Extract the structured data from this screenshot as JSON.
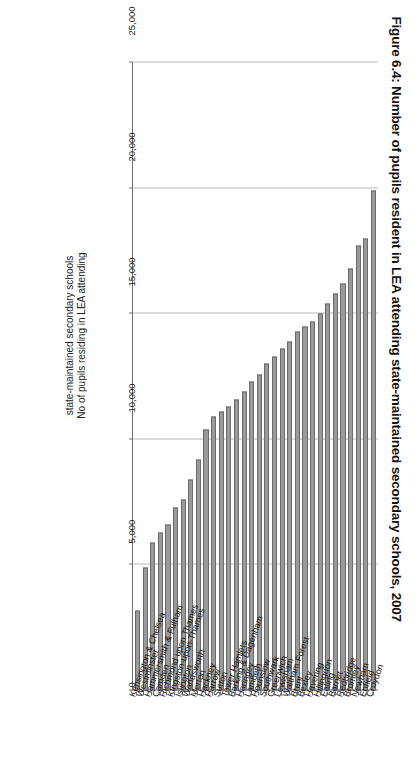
{
  "figure": {
    "title": "Figure 6.4: Number of pupils resident in LEA attending state-maintained secondary schools, 2007",
    "axis_title_line1": "No of pupils residing in LEA attending",
    "axis_title_line2": "state-maintained secondary schools",
    "bar_color": "#9a9a9a",
    "bar_border_color": "#6a6a6a",
    "grid_color": "#b9b9b9",
    "axis_color": "#6f6f6f"
  },
  "chart_data": {
    "type": "bar",
    "orientation": "horizontal",
    "title": "Figure 6.4: Number of pupils resident in LEA attending state-maintained secondary schools, 2007",
    "xlabel": "No of pupils residing in LEA attending state-maintained secondary schools",
    "ylabel": "",
    "xlim": [
      0,
      25000
    ],
    "tick_values": [
      0,
      5000,
      10000,
      15000,
      20000,
      25000
    ],
    "tick_labels": [
      "0",
      "5,000",
      "10,000",
      "15,000",
      "20,000",
      "25,000"
    ],
    "grid": true,
    "legend": false,
    "categories": [
      "Croydon",
      "Enfield",
      "Newham",
      "Bromley",
      "Redbridge",
      "Barnet",
      "Ealing",
      "Hillingdon",
      "Havering",
      "Bexley",
      "Brent",
      "Waltham Forest",
      "Lewisham",
      "Greenwich",
      "Southwark",
      "Hounslow",
      "Lambeth",
      "Haringey",
      "Barking & Dagenham",
      "Tower Hamlets",
      "Sutton",
      "Harrow",
      "Hackney",
      "Merton",
      "Wandsworth",
      "Islington",
      "Kingston-upon-Thames",
      "Richmond upon Thames",
      "Camden",
      "Hammersmith & Fulham",
      "Westminster",
      "Kensington & Chelsea"
    ],
    "values": [
      19900,
      18000,
      17700,
      16800,
      16200,
      15800,
      15400,
      15000,
      14700,
      14500,
      14300,
      13900,
      13600,
      13300,
      13000,
      12600,
      12300,
      11900,
      11600,
      11300,
      11100,
      10900,
      10400,
      9200,
      8400,
      7600,
      7300,
      6600,
      6300,
      5900,
      4900,
      3200
    ]
  }
}
